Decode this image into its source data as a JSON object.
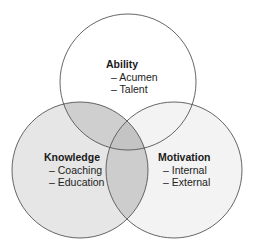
{
  "diagram": {
    "type": "venn",
    "circles": [
      {
        "id": "ability",
        "title": "Ability",
        "items": [
          "– Acumen",
          "– Talent"
        ],
        "fill": "#ffffff"
      },
      {
        "id": "knowledge",
        "title": "Knowledge",
        "items": [
          "– Coaching",
          "– Education"
        ],
        "fill": "#e6e6e6"
      },
      {
        "id": "motivation",
        "title": "Motivation",
        "items": [
          "– Internal",
          "– External"
        ],
        "fill": "#f3f3f3"
      }
    ],
    "colors": {
      "stroke": "#555555",
      "overlap_ability_knowledge": "#cfcfcf",
      "overlap_knowledge_motivation": "#cdcdcd",
      "overlap_all": "#c4c4c4"
    }
  }
}
